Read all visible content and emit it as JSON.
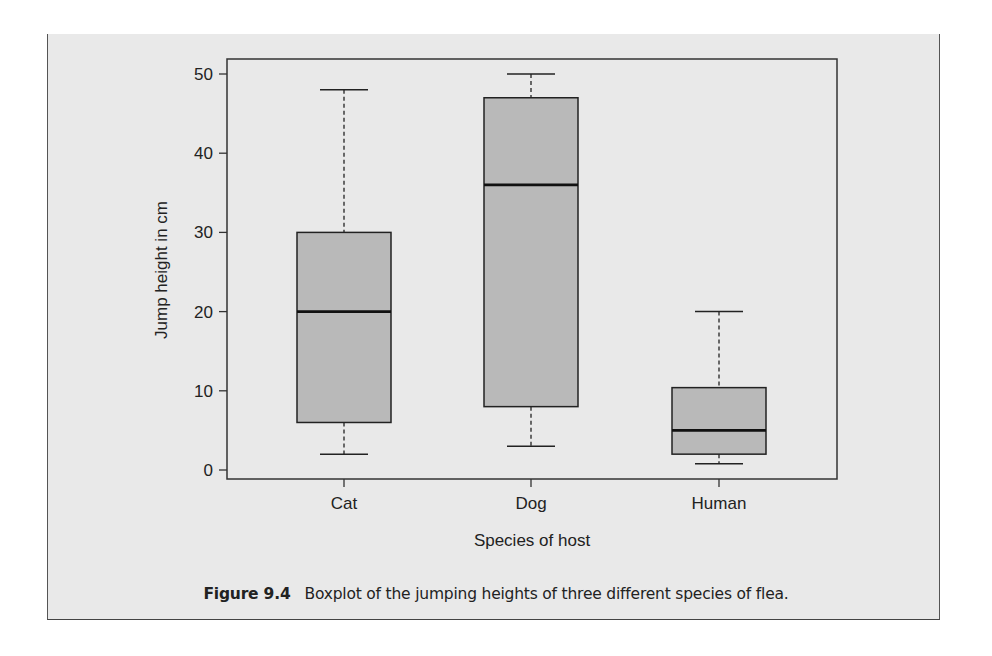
{
  "figure": {
    "label": "Figure 9.4",
    "caption": "Boxplot of the jumping heights of three different species of flea."
  },
  "chart_data": {
    "type": "boxplot",
    "title": "",
    "xlabel": "Species of host",
    "ylabel": "Jump height in cm",
    "categories": [
      "Cat",
      "Dog",
      "Human"
    ],
    "ylim": [
      0,
      50
    ],
    "yticks": [
      0,
      10,
      20,
      30,
      40,
      50
    ],
    "grid": false,
    "legend": null,
    "boxes": [
      {
        "name": "Cat",
        "whisker_low": 2,
        "q1": 6,
        "median": 20,
        "q3": 30,
        "whisker_high": 48
      },
      {
        "name": "Dog",
        "whisker_low": 3,
        "q1": 8,
        "median": 36,
        "q3": 47,
        "whisker_high": 50
      },
      {
        "name": "Human",
        "whisker_low": 0.8,
        "q1": 2,
        "median": 5,
        "q3": 10.4,
        "whisker_high": 20
      }
    ],
    "colors": {
      "box_fill": "#b9b9b9",
      "line": "#222222"
    }
  }
}
